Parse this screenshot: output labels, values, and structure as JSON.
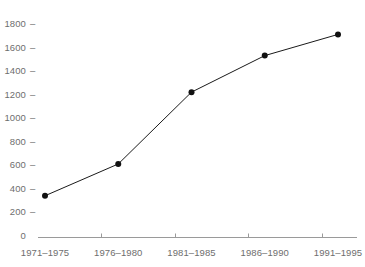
{
  "chart_data": {
    "type": "line",
    "title": "",
    "subtitle": "",
    "xlabel": "",
    "ylabel": "",
    "categories": [
      "1971–1975",
      "1976–1980",
      "1981–1985",
      "1986–1990",
      "1991–1995"
    ],
    "values": [
      350,
      620,
      1230,
      1540,
      1720
    ],
    "series": [
      {
        "name": "",
        "values": [
          350,
          620,
          1230,
          1540,
          1720
        ]
      }
    ],
    "ylim": [
      0,
      1800
    ],
    "yticks": [
      0,
      200,
      400,
      600,
      800,
      1000,
      1200,
      1400,
      1600,
      1800
    ],
    "ytick_labels": [
      "0",
      "200",
      "400",
      "600",
      "800",
      "1000",
      "1200",
      "1400",
      "1600",
      "1800"
    ],
    "xtick_labels": [
      "1971–1975",
      "1976–1980",
      "1981–1985",
      "1986–1990",
      "1991–1995"
    ],
    "grid": false,
    "legend": false,
    "legend_position": "none",
    "markers": "filled-circle",
    "annotations": []
  },
  "style": {
    "text_color": "#6e6e6e",
    "axis_color": "#9a9a9a",
    "line_color": "#1a1a1a",
    "marker_color": "#111111",
    "background": "#ffffff"
  },
  "axis": {
    "y_tick_dash": "–",
    "zero_label": "0"
  }
}
